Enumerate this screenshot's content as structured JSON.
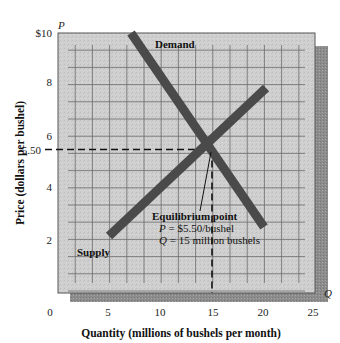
{
  "chart_data": {
    "type": "line",
    "title": "",
    "xlabel": "Quantity (millions of bushels per month)",
    "ylabel": "Price (dollars per bushel)",
    "x_axis_symbol": "Q",
    "y_axis_symbol": "P",
    "xlim": [
      0,
      25
    ],
    "ylim": [
      0,
      10
    ],
    "x_ticks": [
      0,
      5,
      10,
      15,
      20,
      25
    ],
    "x_tick_labels": [
      "0",
      "5",
      "10",
      "15",
      "20",
      "25"
    ],
    "y_ticks": [
      2,
      4,
      5.5,
      6,
      8,
      10
    ],
    "y_tick_labels": [
      "2",
      "4",
      "5.50",
      "6",
      "8",
      "$10"
    ],
    "grid": true,
    "legend": "none (curves labeled directly)",
    "series": [
      {
        "name": "Demand",
        "points": [
          [
            7.2,
            10
          ],
          [
            20,
            2.5
          ]
        ]
      },
      {
        "name": "Supply",
        "points": [
          [
            5,
            2.1
          ],
          [
            20.2,
            7.8
          ]
        ]
      }
    ],
    "annotations": [
      {
        "text": "Equilibrium point",
        "lines": [
          "P = $5.50/bushel",
          "Q = 15 million bushels"
        ],
        "point": [
          15,
          5.5
        ]
      }
    ],
    "reference_lines": [
      {
        "type": "horizontal-dashed",
        "y": 5.5,
        "x_range": [
          0,
          15
        ]
      },
      {
        "type": "vertical-dashed",
        "x": 15,
        "y_range": [
          0,
          5.5
        ]
      }
    ]
  },
  "labels": {
    "y_symbol": "P",
    "x_symbol": "Q",
    "demand": "Demand",
    "supply": "Supply",
    "eq_title": "Equilibrium point",
    "eq_p_sym": "P",
    "eq_p_val": " = $5.50/bushel",
    "eq_q_sym": "Q",
    "eq_q_val": " = 15 million bushels",
    "xlabel": "Quantity (millions of bushels per month)",
    "ylabel": "Price (dollars per bushel)",
    "y_ticks": [
      "$10",
      "8",
      "6",
      "5.50",
      "4",
      "2"
    ],
    "x_ticks": [
      "0",
      "5",
      "10",
      "15",
      "20",
      "25"
    ]
  },
  "colors": {
    "plot_bg": "#c9c9c9",
    "shadow": "#8a8a8a",
    "grid": "#555555",
    "curve": "#4a4a4a",
    "text": "#111111"
  }
}
